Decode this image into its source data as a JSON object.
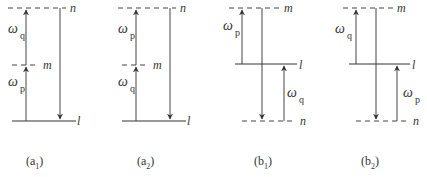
{
  "panels": [
    {
      "id": "a1",
      "caption": {
        "letter": "a",
        "sub": "1"
      },
      "levels": {
        "top": "n",
        "mid": "m",
        "bottom": "l"
      },
      "lower_freq": {
        "sym": "ω",
        "sub": "p"
      },
      "upper_freq": {
        "sym": "ω",
        "sub": "q"
      }
    },
    {
      "id": "a2",
      "caption": {
        "letter": "a",
        "sub": "2"
      },
      "levels": {
        "top": "n",
        "mid": "m",
        "bottom": "l"
      },
      "lower_freq": {
        "sym": "ω",
        "sub": "q"
      },
      "upper_freq": {
        "sym": "ω",
        "sub": "p"
      }
    },
    {
      "id": "b1",
      "caption": {
        "letter": "b",
        "sub": "1"
      },
      "levels": {
        "top": "m",
        "mid": "l",
        "bottom": "n"
      },
      "left_freq": {
        "sym": "ω",
        "sub": "p"
      },
      "right_freq": {
        "sym": "ω",
        "sub": "q"
      }
    },
    {
      "id": "b2",
      "caption": {
        "letter": "b",
        "sub": "2"
      },
      "levels": {
        "top": "m",
        "mid": "l",
        "bottom": "n"
      },
      "left_freq": {
        "sym": "ω",
        "sub": "q"
      },
      "right_freq": {
        "sym": "ω",
        "sub": "p"
      }
    }
  ],
  "colors": {
    "line": "#333333",
    "background": "#ffffff"
  }
}
